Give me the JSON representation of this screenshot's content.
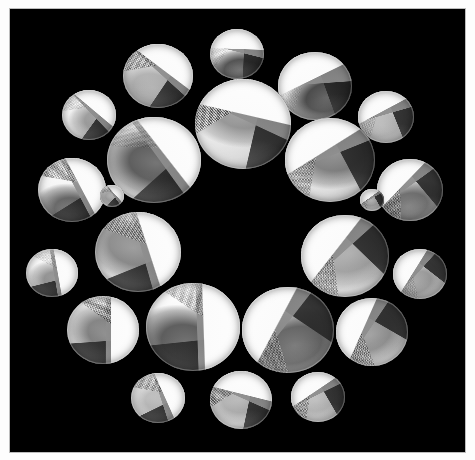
{
  "artwork": {
    "title": "Circular arrangement of lens discs",
    "medium_appearance": "black-and-white photographic collage",
    "background_color": "#000000",
    "paper_color": "#fdfdfd",
    "plate": {
      "x": 10,
      "y": 9,
      "width": 455,
      "height": 443
    },
    "composition": "ring of 23 circular lens elements around an empty black center",
    "center_region": {
      "x": 238,
      "y": 230,
      "description": "empty black void"
    }
  },
  "palette": {
    "black": "#000000",
    "white": "#ffffff",
    "mid_gray": "#8e8e8e",
    "dark_gray": "#272727",
    "light_gray": "#d8d8d8",
    "paper": "#fdfdfd",
    "plate_border": "#bdbdbd"
  },
  "discs": [
    {
      "id": "disc-top-center-small",
      "cx": 237,
      "cy": 54,
      "rx": 27,
      "ry": 25,
      "rot": -4,
      "wa": 186,
      "wb": 18,
      "wc": 96,
      "ha": 40,
      "hm": 132,
      "bx": 52,
      "by": 70,
      "blob": 0.85,
      "halftone": 0.25,
      "tone": "bright-top-dark-bottom"
    },
    {
      "id": "disc-top-left",
      "cx": 158,
      "cy": 76,
      "rx": 35,
      "ry": 32,
      "rot": 12,
      "wa": 205,
      "wb": 30,
      "wc": 112,
      "ha": 52,
      "hm": 158,
      "bx": 48,
      "by": 62,
      "blob": 0.35,
      "halftone": 0.8,
      "tone": "bright-upper-left"
    },
    {
      "id": "disc-top-right",
      "cx": 315,
      "cy": 86,
      "rx": 37,
      "ry": 34,
      "rot": -14,
      "wa": 168,
      "wb": 10,
      "wc": 84,
      "ha": 64,
      "hm": 122,
      "bx": 58,
      "by": 62,
      "blob": 0.9,
      "halftone": 0.2,
      "tone": "bright-top-dark-lower"
    },
    {
      "id": "disc-upper-left-small",
      "cx": 89,
      "cy": 115,
      "rx": 27,
      "ry": 25,
      "rot": 6,
      "wa": 214,
      "wb": 40,
      "wc": 120,
      "ha": 34,
      "hm": 166,
      "bx": 64,
      "by": 56,
      "blob": 0.45,
      "halftone": 0.3,
      "tone": "mostly-white"
    },
    {
      "id": "disc-upper-right-small",
      "cx": 386,
      "cy": 117,
      "rx": 28,
      "ry": 26,
      "rot": -8,
      "wa": 160,
      "wb": 352,
      "wc": 76,
      "ha": 70,
      "hm": 114,
      "bx": 44,
      "by": 60,
      "blob": 0.3,
      "halftone": 0.35,
      "tone": "white-with-dark-wedge"
    },
    {
      "id": "disc-center-top-large",
      "cx": 243,
      "cy": 124,
      "rx": 48,
      "ry": 45,
      "rot": 3,
      "wa": 190,
      "wb": 22,
      "wc": 100,
      "ha": 46,
      "hm": 146,
      "bx": 50,
      "by": 40,
      "blob": 0.5,
      "halftone": 0.75,
      "tone": "architectural-bright-base"
    },
    {
      "id": "disc-left-large",
      "cx": 154,
      "cy": 160,
      "rx": 47,
      "ry": 43,
      "rot": 10,
      "wa": 222,
      "wb": 44,
      "wc": 128,
      "ha": 38,
      "hm": 172,
      "bx": 52,
      "by": 52,
      "blob": 0.8,
      "halftone": 0.3,
      "tone": "bright-with-dark-core"
    },
    {
      "id": "disc-right-large",
      "cx": 330,
      "cy": 160,
      "rx": 45,
      "ry": 42,
      "rot": -10,
      "wa": 158,
      "wb": 348,
      "wc": 72,
      "ha": 58,
      "hm": 110,
      "bx": 56,
      "by": 46,
      "blob": 0.6,
      "halftone": 0.7,
      "tone": "dark-wedge-dominant"
    },
    {
      "id": "disc-left-mid",
      "cx": 72,
      "cy": 190,
      "rx": 34,
      "ry": 32,
      "rot": 14,
      "wa": 228,
      "wb": 48,
      "wc": 134,
      "ha": 44,
      "hm": 176,
      "bx": 56,
      "by": 70,
      "blob": 0.75,
      "halftone": 0.8,
      "tone": "halftone-upper-dark-lower"
    },
    {
      "id": "disc-right-mid",
      "cx": 410,
      "cy": 190,
      "rx": 33,
      "ry": 31,
      "rot": -16,
      "wa": 150,
      "wb": 340,
      "wc": 66,
      "ha": 62,
      "hm": 104,
      "bx": 44,
      "by": 66,
      "blob": 0.7,
      "halftone": 0.7,
      "tone": "dark-left-bright-right"
    },
    {
      "id": "disc-left-inner",
      "cx": 138,
      "cy": 252,
      "rx": 43,
      "ry": 40,
      "rot": 18,
      "wa": 234,
      "wb": 56,
      "wc": 140,
      "ha": 36,
      "hm": 182,
      "bx": 46,
      "by": 48,
      "blob": 0.55,
      "halftone": 0.55,
      "tone": "bright-right-wedge"
    },
    {
      "id": "disc-right-inner",
      "cx": 345,
      "cy": 256,
      "rx": 44,
      "ry": 41,
      "rot": -18,
      "wa": 146,
      "wb": 336,
      "wc": 62,
      "ha": 66,
      "hm": 100,
      "bx": 54,
      "by": 50,
      "blob": 0.4,
      "halftone": 0.75,
      "tone": "bright-left-halftone-right"
    },
    {
      "id": "disc-far-left-small",
      "cx": 52,
      "cy": 273,
      "rx": 26,
      "ry": 24,
      "rot": 20,
      "wa": 240,
      "wb": 60,
      "wc": 146,
      "ha": 30,
      "hm": 188,
      "bx": 62,
      "by": 58,
      "blob": 0.5,
      "halftone": 0.25,
      "tone": "white-with-grey-right"
    },
    {
      "id": "disc-far-right-small",
      "cx": 420,
      "cy": 274,
      "rx": 27,
      "ry": 25,
      "rot": -20,
      "wa": 142,
      "wb": 332,
      "wc": 58,
      "ha": 72,
      "hm": 96,
      "bx": 42,
      "by": 58,
      "blob": 0.45,
      "halftone": 0.3,
      "tone": "dark-left-white-right"
    },
    {
      "id": "disc-lower-left",
      "cx": 103,
      "cy": 330,
      "rx": 36,
      "ry": 34,
      "rot": 24,
      "wa": 246,
      "wb": 66,
      "wc": 152,
      "ha": 42,
      "hm": 192,
      "bx": 56,
      "by": 52,
      "blob": 0.6,
      "halftone": 0.85,
      "tone": "halftone-center-wedges"
    },
    {
      "id": "disc-lower-right",
      "cx": 372,
      "cy": 332,
      "rx": 36,
      "ry": 34,
      "rot": -24,
      "wa": 138,
      "wb": 328,
      "wc": 54,
      "ha": 74,
      "hm": 92,
      "bx": 48,
      "by": 52,
      "blob": 0.5,
      "halftone": 0.8,
      "tone": "diagonal-bright-band"
    },
    {
      "id": "disc-bottom-left-large",
      "cx": 193,
      "cy": 327,
      "rx": 47,
      "ry": 44,
      "rot": 16,
      "wa": 252,
      "wb": 72,
      "wc": 158,
      "ha": 48,
      "hm": 198,
      "bx": 50,
      "by": 62,
      "blob": 0.8,
      "halftone": 0.6,
      "tone": "bright-top-grey-cone"
    },
    {
      "id": "disc-bottom-right-large",
      "cx": 288,
      "cy": 330,
      "rx": 46,
      "ry": 43,
      "rot": -16,
      "wa": 134,
      "wb": 324,
      "wc": 50,
      "ha": 56,
      "hm": 88,
      "bx": 52,
      "by": 62,
      "blob": 0.75,
      "halftone": 0.65,
      "tone": "bright-top-dark-lower-right"
    },
    {
      "id": "disc-bottom-small-1",
      "cx": 158,
      "cy": 398,
      "rx": 27,
      "ry": 25,
      "rot": 10,
      "wa": 236,
      "wb": 62,
      "wc": 144,
      "ha": 50,
      "hm": 180,
      "bx": 54,
      "by": 54,
      "blob": 0.3,
      "halftone": 0.7,
      "tone": "white-lower-halftone-upper-right"
    },
    {
      "id": "disc-bottom-small-2",
      "cx": 241,
      "cy": 400,
      "rx": 31,
      "ry": 29,
      "rot": -2,
      "wa": 196,
      "wb": 26,
      "wc": 104,
      "ha": 44,
      "hm": 150,
      "bx": 50,
      "by": 50,
      "blob": 0.35,
      "halftone": 0.85,
      "tone": "white-bottom-dark-wedges-top"
    },
    {
      "id": "disc-bottom-small-3",
      "cx": 318,
      "cy": 397,
      "rx": 27,
      "ry": 25,
      "rot": -10,
      "wa": 156,
      "wb": 344,
      "wc": 70,
      "ha": 60,
      "hm": 108,
      "bx": 48,
      "by": 54,
      "blob": 0.3,
      "halftone": 0.75,
      "tone": "white-lower-crosshatch-upper-left"
    },
    {
      "id": "disc-mid-left-upper",
      "cx": 112,
      "cy": 196,
      "rx": 12,
      "ry": 11,
      "rot": 8,
      "wa": 220,
      "wb": 46,
      "wc": 126,
      "ha": 40,
      "hm": 170,
      "bx": 52,
      "by": 54,
      "blob": 0.4,
      "halftone": 0.4,
      "tone": "small-accent"
    },
    {
      "id": "disc-mid-right-upper",
      "cx": 372,
      "cy": 200,
      "rx": 12,
      "ry": 11,
      "rot": -8,
      "wa": 152,
      "wb": 338,
      "wc": 68,
      "ha": 64,
      "hm": 106,
      "bx": 48,
      "by": 54,
      "blob": 0.4,
      "halftone": 0.4,
      "tone": "small-accent"
    }
  ]
}
